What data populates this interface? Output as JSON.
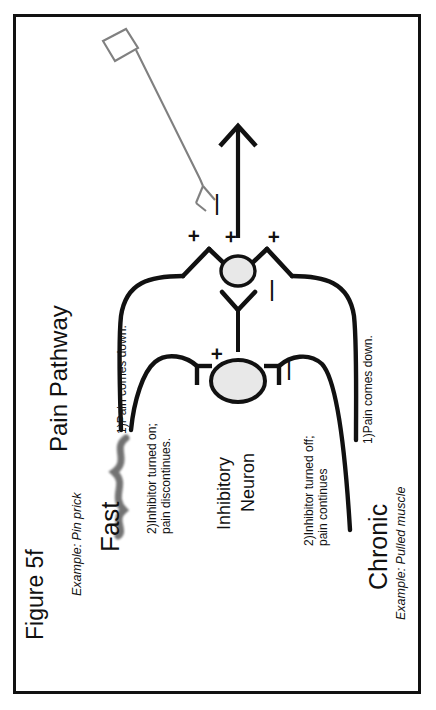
{
  "figure": {
    "label": "Figure 5f",
    "title": "Pain Pathway"
  },
  "left_branch": {
    "heading": "Fast",
    "example": "Example: Pin prick",
    "step1": "1)Pain comes down.",
    "step2_line1": "2)Inhibitor turned on;",
    "step2_line2": "pain discontinues.",
    "sign": "+"
  },
  "right_branch": {
    "heading": "Chronic",
    "example": "Example: Pulled muscle",
    "step1": "1)Pain comes down.",
    "step2_line1": "2)Inhibitor turned off;",
    "step2_line2": "pain continues",
    "sign": "—"
  },
  "inhibitory_neuron": {
    "label_line1": "Inhibitory",
    "label_line2": "Neuron"
  },
  "synapse": {
    "plus_left": "+",
    "plus_center": "+",
    "plus_right": "+",
    "minus": "—"
  },
  "descending_inhibitor": {
    "minus": "—",
    "icon": "gray-square-terminal"
  },
  "ascending_arrow": {
    "icon": "up-arrow-to-brain"
  },
  "colors": {
    "ink": "#111111",
    "gray_line": "#808080",
    "neuron_fill": "#e8e8e8",
    "frame": "#111111",
    "background": "#ffffff"
  }
}
